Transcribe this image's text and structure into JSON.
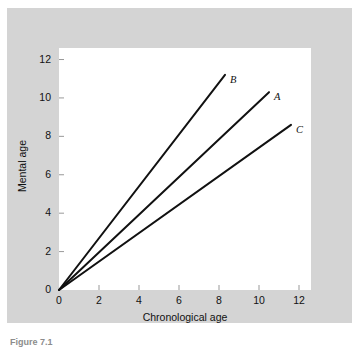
{
  "chart_data": {
    "type": "line",
    "title": "",
    "xlabel": "Chronological age",
    "ylabel": "Mental age",
    "xlim": [
      0,
      12.6
    ],
    "ylim": [
      0,
      12.6
    ],
    "xticks": [
      "0",
      "2",
      "4",
      "6",
      "8",
      "10",
      "12"
    ],
    "yticks": [
      "0",
      "2",
      "4",
      "6",
      "8",
      "10",
      "12"
    ],
    "xtick_values": [
      0,
      2,
      4,
      6,
      8,
      10,
      12
    ],
    "ytick_values": [
      0,
      2,
      4,
      6,
      8,
      10,
      12
    ],
    "grid": false,
    "legend_position": "inline-end-of-line",
    "series": [
      {
        "name": "B",
        "label": "B",
        "slope": 1.35,
        "x": [
          0,
          8.3
        ],
        "values": [
          0,
          11.2
        ],
        "color": "#111111"
      },
      {
        "name": "A",
        "label": "A",
        "slope": 0.98,
        "x": [
          0,
          10.5
        ],
        "values": [
          0,
          10.3
        ],
        "color": "#111111"
      },
      {
        "name": "C",
        "label": "C",
        "slope": 0.74,
        "x": [
          0,
          11.6
        ],
        "values": [
          0,
          8.6
        ],
        "color": "#111111"
      }
    ]
  },
  "figure": {
    "caption": "Figure 7.1",
    "panel_color": "#d4d4d4",
    "plot_background": "#ffffff",
    "ink_color": "#111111"
  }
}
